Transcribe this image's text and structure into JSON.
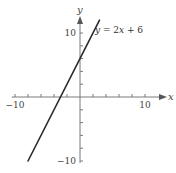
{
  "chart_data": {
    "type": "line",
    "title": "",
    "xlabel": "x",
    "ylabel": "y",
    "xlim": [
      -10,
      12
    ],
    "ylim": [
      -10,
      12
    ],
    "x_ticks": [
      -10,
      -8,
      -6,
      -4,
      -2,
      2,
      4,
      6,
      8,
      10
    ],
    "y_ticks": [
      -10,
      -8,
      -6,
      -4,
      -2,
      2,
      4,
      6,
      8,
      10
    ],
    "x_tick_labels": [
      {
        "value": -10,
        "label": "−10"
      },
      {
        "value": 10,
        "label": "10"
      }
    ],
    "y_tick_labels": [
      {
        "value": 10,
        "label": "10"
      },
      {
        "value": -10,
        "label": "−10"
      }
    ],
    "grid": false,
    "series": [
      {
        "name": "y = 2x + 6",
        "equation": {
          "slope": 2,
          "intercept": 6
        },
        "x": [
          -8,
          3
        ],
        "y": [
          -10,
          12
        ]
      }
    ],
    "annotations": [
      {
        "text": "y = 2x + 6",
        "x": 2.3,
        "y": 10
      }
    ]
  }
}
